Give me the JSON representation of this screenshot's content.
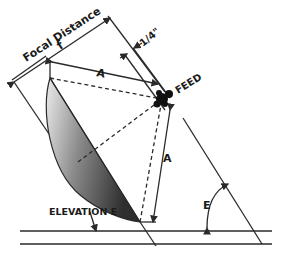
{
  "diagram": {
    "labels": {
      "focal_distance": "Focal Distance",
      "focal_symbol": "f",
      "offset": "1/4\"",
      "feed": "FEED",
      "a_top": "A",
      "a_right": "A",
      "elevation": "ELEVATION E",
      "e_angle": "E"
    },
    "colors": {
      "line": "#2a2a2a",
      "dish_dark": "#3a3a3a",
      "dish_light": "#e8e8e8",
      "background": "#ffffff"
    }
  }
}
